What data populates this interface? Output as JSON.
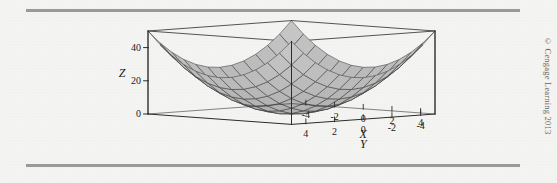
{
  "figure": {
    "credit": "© Cengage Learning 2013",
    "background_color": "#f4f4f2",
    "rule_color": "#9a9a9a"
  },
  "chart_data": {
    "type": "surface",
    "title": "",
    "function": "z = x^2 + y^2",
    "projection": "3d-wireframe-mesh",
    "xlabel": "X",
    "ylabel": "Y",
    "zlabel": "Z",
    "xlim": [
      -5,
      5
    ],
    "ylim": [
      -5,
      5
    ],
    "zlim": [
      0,
      50
    ],
    "x_ticks": [
      -4,
      -2,
      0,
      2,
      4
    ],
    "x_tick_labels": [
      "-4",
      "-2",
      "0",
      "2",
      "4"
    ],
    "y_ticks": [
      4,
      2,
      0,
      -2,
      -4
    ],
    "y_tick_labels": [
      "4",
      "2",
      "0",
      "-2",
      "-4"
    ],
    "z_ticks": [
      0,
      20,
      40
    ],
    "z_tick_labels": [
      "0",
      "20",
      "40"
    ],
    "grid": false,
    "legend": false,
    "mesh_divisions": 12,
    "surface_fill": "#b9b9b9",
    "surface_line": "#3c3c3c",
    "box_line": "#2b2b2b"
  }
}
